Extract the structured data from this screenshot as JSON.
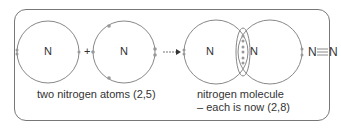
{
  "diagram": {
    "atom_symbol": "N",
    "plus": "+",
    "caption_left": "two nitrogen atoms (2,5)",
    "caption_right_line1": "nitrogen molecule",
    "caption_right_line2": "– each is now (2,8)",
    "formula_left": "N",
    "formula_right": "N",
    "bond": "triple-bond",
    "colors": {
      "line": "#777777",
      "text": "#333333",
      "electron": "#999999"
    }
  }
}
